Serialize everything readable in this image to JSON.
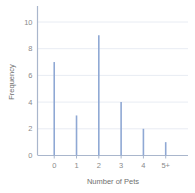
{
  "chart_data": {
    "type": "bar",
    "title": "",
    "subtitle": "",
    "xlabel": "Number of Pets",
    "ylabel": "Frequency",
    "categories": [
      "0",
      "1",
      "2",
      "3",
      "4",
      "5+"
    ],
    "values": [
      7,
      3,
      9,
      4,
      2,
      1
    ],
    "series": [
      {
        "name": "Frequency",
        "values": [
          7,
          3,
          9,
          4,
          2,
          1
        ]
      }
    ],
    "xlim": [
      -0.75,
      6.0
    ],
    "ylim": [
      0,
      11
    ],
    "yticks": [
      0,
      2,
      4,
      6,
      8,
      10
    ],
    "yticklabels": [
      "0",
      "2",
      "4",
      "6",
      "8",
      "10"
    ],
    "xticklabels": [
      "0",
      "1",
      "2",
      "3",
      "4",
      "5+"
    ],
    "grid": true,
    "grid_axis": "y",
    "legend": false,
    "legend_position": "none",
    "bar_style": "thin-needle",
    "colors": {
      "bar": "#8fa8d4",
      "gridline": "#e8ecf3",
      "axis": "#a9b6cc",
      "tick_label": "#8a8a8a",
      "axis_title": "#6f6f6f",
      "background": "#ffffff"
    }
  }
}
